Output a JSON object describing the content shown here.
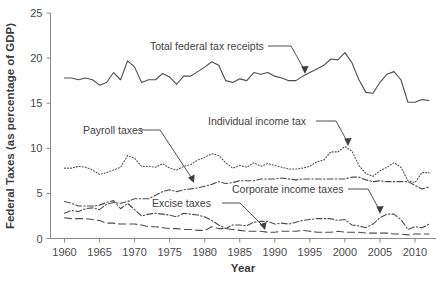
{
  "chart_data": {
    "type": "line",
    "title": "",
    "xlabel": "Year",
    "ylabel": "Federal Taxes (as percentage of GDP)",
    "xlim": [
      1958,
      2013
    ],
    "ylim": [
      0,
      25
    ],
    "yticks": [
      0,
      5,
      10,
      15,
      20,
      25
    ],
    "xticks": [
      1960,
      1965,
      1970,
      1975,
      1980,
      1985,
      1990,
      1995,
      2000,
      2005,
      2010
    ],
    "grid": false,
    "legend": "annotations",
    "series": [
      {
        "name": "Total federal tax receipts",
        "style": "solid",
        "x": [
          1960,
          1961,
          1962,
          1963,
          1964,
          1965,
          1966,
          1967,
          1968,
          1969,
          1970,
          1971,
          1972,
          1973,
          1974,
          1975,
          1976,
          1977,
          1978,
          1979,
          1980,
          1981,
          1982,
          1983,
          1984,
          1985,
          1986,
          1987,
          1988,
          1989,
          1990,
          1991,
          1992,
          1993,
          1994,
          1995,
          1996,
          1997,
          1998,
          1999,
          2000,
          2001,
          2002,
          2003,
          2004,
          2005,
          2006,
          2007,
          2008,
          2009,
          2010,
          2011,
          2012
        ],
        "values": [
          17.8,
          17.8,
          17.6,
          17.8,
          17.6,
          17.0,
          17.3,
          18.4,
          17.6,
          19.7,
          19.0,
          17.3,
          17.6,
          17.6,
          18.3,
          17.9,
          17.1,
          18.0,
          18.0,
          18.5,
          19.0,
          19.6,
          19.2,
          17.5,
          17.3,
          17.7,
          17.5,
          18.4,
          18.2,
          18.4,
          18.0,
          17.8,
          17.5,
          17.5,
          18.0,
          18.4,
          18.8,
          19.2,
          19.9,
          19.8,
          20.6,
          19.5,
          17.6,
          16.2,
          16.1,
          17.3,
          18.2,
          18.5,
          17.6,
          15.1,
          15.1,
          15.4,
          15.3
        ]
      },
      {
        "name": "Individual income tax",
        "style": "dotted",
        "x": [
          1960,
          1961,
          1962,
          1963,
          1964,
          1965,
          1966,
          1967,
          1968,
          1969,
          1970,
          1971,
          1972,
          1973,
          1974,
          1975,
          1976,
          1977,
          1978,
          1979,
          1980,
          1981,
          1982,
          1983,
          1984,
          1985,
          1986,
          1987,
          1988,
          1989,
          1990,
          1991,
          1992,
          1993,
          1994,
          1995,
          1996,
          1997,
          1998,
          1999,
          2000,
          2001,
          2002,
          2003,
          2004,
          2005,
          2006,
          2007,
          2008,
          2009,
          2010,
          2011,
          2012
        ],
        "values": [
          7.8,
          7.8,
          8.0,
          7.9,
          7.6,
          7.1,
          7.3,
          7.6,
          7.9,
          9.2,
          8.9,
          8.0,
          8.0,
          7.9,
          8.3,
          7.8,
          7.6,
          8.0,
          8.2,
          8.7,
          9.0,
          9.4,
          9.2,
          8.4,
          7.8,
          8.1,
          7.9,
          8.4,
          8.0,
          8.3,
          8.1,
          7.9,
          7.7,
          7.7,
          7.8,
          8.0,
          8.5,
          8.7,
          9.6,
          9.6,
          10.2,
          9.7,
          8.1,
          7.2,
          6.9,
          7.5,
          7.9,
          8.4,
          7.9,
          6.4,
          6.2,
          7.3,
          7.3
        ]
      },
      {
        "name": "Payroll taxes",
        "style": "dashdot",
        "x": [
          1960,
          1961,
          1962,
          1963,
          1964,
          1965,
          1966,
          1967,
          1968,
          1969,
          1970,
          1971,
          1972,
          1973,
          1974,
          1975,
          1976,
          1977,
          1978,
          1979,
          1980,
          1981,
          1982,
          1983,
          1984,
          1985,
          1986,
          1987,
          1988,
          1989,
          1990,
          1991,
          1992,
          1993,
          1994,
          1995,
          1996,
          1997,
          1998,
          1999,
          2000,
          2001,
          2002,
          2003,
          2004,
          2005,
          2006,
          2007,
          2008,
          2009,
          2010,
          2011,
          2012
        ],
        "values": [
          2.8,
          3.1,
          3.0,
          3.3,
          3.4,
          3.2,
          3.8,
          4.0,
          3.9,
          4.1,
          4.4,
          4.4,
          4.4,
          4.8,
          5.2,
          5.4,
          5.2,
          5.4,
          5.5,
          5.6,
          5.8,
          6.0,
          6.3,
          6.1,
          6.2,
          6.4,
          6.4,
          6.4,
          6.6,
          6.6,
          6.6,
          6.7,
          6.6,
          6.5,
          6.6,
          6.6,
          6.6,
          6.6,
          6.6,
          6.6,
          6.6,
          6.8,
          6.8,
          6.5,
          6.3,
          6.4,
          6.3,
          6.3,
          6.3,
          6.3,
          5.9,
          5.5,
          5.7
        ]
      },
      {
        "name": "Corporate income taxes",
        "style": "dashdot",
        "x": [
          1960,
          1961,
          1962,
          1963,
          1964,
          1965,
          1966,
          1967,
          1968,
          1969,
          1970,
          1971,
          1972,
          1973,
          1974,
          1975,
          1976,
          1977,
          1978,
          1979,
          1980,
          1981,
          1982,
          1983,
          1984,
          1985,
          1986,
          1987,
          1988,
          1989,
          1990,
          1991,
          1992,
          1993,
          1994,
          1995,
          1996,
          1997,
          1998,
          1999,
          2000,
          2001,
          2002,
          2003,
          2004,
          2005,
          2006,
          2007,
          2008,
          2009,
          2010,
          2011,
          2012
        ],
        "values": [
          4.1,
          3.9,
          3.6,
          3.6,
          3.6,
          3.7,
          4.0,
          4.2,
          3.3,
          3.9,
          3.2,
          2.5,
          2.7,
          2.8,
          2.7,
          2.6,
          2.4,
          2.8,
          2.7,
          2.6,
          2.4,
          2.0,
          1.5,
          1.1,
          1.5,
          1.5,
          1.4,
          1.8,
          1.9,
          1.9,
          1.6,
          1.7,
          1.6,
          1.8,
          2.0,
          2.1,
          2.2,
          2.2,
          2.2,
          2.0,
          2.1,
          1.5,
          1.4,
          1.2,
          1.6,
          2.3,
          2.7,
          2.7,
          2.1,
          1.0,
          1.3,
          1.2,
          1.6
        ]
      },
      {
        "name": "Excise taxes",
        "style": "longdash",
        "x": [
          1960,
          1961,
          1962,
          1963,
          1964,
          1965,
          1966,
          1967,
          1968,
          1969,
          1970,
          1971,
          1972,
          1973,
          1974,
          1975,
          1976,
          1977,
          1978,
          1979,
          1980,
          1981,
          1982,
          1983,
          1984,
          1985,
          1986,
          1987,
          1988,
          1989,
          1990,
          1991,
          1992,
          1993,
          1994,
          1995,
          1996,
          1997,
          1998,
          1999,
          2000,
          2001,
          2002,
          2003,
          2004,
          2005,
          2006,
          2007,
          2008,
          2009,
          2010,
          2011,
          2012
        ],
        "values": [
          2.3,
          2.2,
          2.2,
          2.2,
          2.1,
          2.0,
          1.7,
          1.7,
          1.6,
          1.6,
          1.6,
          1.5,
          1.3,
          1.3,
          1.2,
          1.1,
          1.1,
          1.0,
          1.0,
          0.9,
          0.9,
          1.3,
          1.1,
          1.1,
          1.0,
          0.9,
          0.8,
          0.8,
          0.8,
          0.7,
          0.7,
          0.8,
          0.8,
          0.8,
          0.9,
          0.8,
          0.7,
          0.7,
          0.7,
          0.8,
          0.7,
          0.7,
          0.7,
          0.6,
          0.6,
          0.6,
          0.6,
          0.5,
          0.5,
          0.4,
          0.5,
          0.5,
          0.5
        ]
      }
    ],
    "annotations": [
      {
        "id": "total-federal-tax-receipts",
        "label": "Total federal tax receipts",
        "target_year": 1988,
        "target_value": 18.2
      },
      {
        "id": "individual-income-tax",
        "label": "Individual income tax",
        "target_year": 2000,
        "target_value": 10.2
      },
      {
        "id": "payroll-taxes",
        "label": "Payroll taxes",
        "target_year": 1975,
        "target_value": 5.4
      },
      {
        "id": "corporate-income-taxes",
        "label": "Corporate income taxes",
        "target_year": 2004,
        "target_value": 1.6
      },
      {
        "id": "excise-taxes",
        "label": "Excise taxes",
        "target_year": 1989,
        "target_value": 0.7
      }
    ]
  },
  "axes": {
    "y_title": "Federal Taxes (as percentage of GDP)",
    "x_title": "Year",
    "y_tick_labels": [
      "25",
      "20",
      "15",
      "10",
      "5",
      "0"
    ],
    "x_tick_labels": [
      "1960",
      "1965",
      "1970",
      "1975",
      "1980",
      "1985",
      "1990",
      "1995",
      "2000",
      "2005",
      "2010"
    ]
  },
  "annotation_labels": {
    "total": "Total federal tax receipts",
    "individual": "Individual income tax",
    "payroll": "Payroll taxes",
    "corporate": "Corporate income taxes",
    "excise": "Excise taxes"
  },
  "colors": {
    "line": "#4d4d4d",
    "axis": "#8a8a8a",
    "text": "#3f3f3f",
    "background": "#ffffff"
  }
}
